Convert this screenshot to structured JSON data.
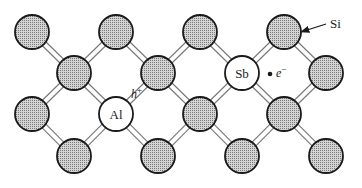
{
  "diagram": {
    "atom_radius": 17,
    "colors": {
      "outline": "#1a1a1a",
      "shaded_fill": "#b8b8b8",
      "impurity_fill": "#ffffff",
      "bond": "#777777"
    },
    "atoms": [
      {
        "id": "a1",
        "x": 32,
        "y": 32,
        "type": "Si",
        "label": ""
      },
      {
        "id": "a2",
        "x": 116,
        "y": 32,
        "type": "Si",
        "label": ""
      },
      {
        "id": "a3",
        "x": 200,
        "y": 32,
        "type": "Si",
        "label": ""
      },
      {
        "id": "a4",
        "x": 284,
        "y": 32,
        "type": "Si",
        "label": ""
      },
      {
        "id": "b1",
        "x": 74,
        "y": 73,
        "type": "Si",
        "label": ""
      },
      {
        "id": "b2",
        "x": 158,
        "y": 73,
        "type": "Si",
        "label": ""
      },
      {
        "id": "b3",
        "x": 242,
        "y": 73,
        "type": "Sb",
        "label": "Sb"
      },
      {
        "id": "b4",
        "x": 326,
        "y": 73,
        "type": "Si",
        "label": ""
      },
      {
        "id": "c1",
        "x": 32,
        "y": 114,
        "type": "Si",
        "label": ""
      },
      {
        "id": "c2",
        "x": 116,
        "y": 114,
        "type": "Al",
        "label": "Al"
      },
      {
        "id": "c3",
        "x": 200,
        "y": 114,
        "type": "Si",
        "label": ""
      },
      {
        "id": "c4",
        "x": 284,
        "y": 114,
        "type": "Si",
        "label": ""
      },
      {
        "id": "d1",
        "x": 74,
        "y": 156,
        "type": "Si",
        "label": ""
      },
      {
        "id": "d2",
        "x": 158,
        "y": 156,
        "type": "Si",
        "label": ""
      },
      {
        "id": "d3",
        "x": 242,
        "y": 156,
        "type": "Si",
        "label": ""
      },
      {
        "id": "d4",
        "x": 326,
        "y": 156,
        "type": "Si",
        "label": ""
      }
    ],
    "bonds": [
      [
        "a1",
        "b1"
      ],
      [
        "a2",
        "b1"
      ],
      [
        "a2",
        "b2"
      ],
      [
        "a3",
        "b2"
      ],
      [
        "a3",
        "b3"
      ],
      [
        "a4",
        "b3"
      ],
      [
        "a4",
        "b4"
      ],
      [
        "b1",
        "c1"
      ],
      [
        "b1",
        "c2"
      ],
      [
        "b2",
        "c2"
      ],
      [
        "b2",
        "c3"
      ],
      [
        "b3",
        "c3"
      ],
      [
        "b3",
        "c4"
      ],
      [
        "b4",
        "c4"
      ],
      [
        "c1",
        "d1"
      ],
      [
        "c2",
        "d1"
      ],
      [
        "c2",
        "d2"
      ],
      [
        "c3",
        "d2"
      ],
      [
        "c3",
        "d3"
      ],
      [
        "c4",
        "d3"
      ],
      [
        "c4",
        "d4"
      ]
    ],
    "annotations": {
      "si_label": {
        "text": "Si",
        "x": 330,
        "y": 28,
        "arrow_from": [
          326,
          24
        ],
        "arrow_to": [
          301,
          32
        ]
      },
      "hole_label": {
        "text": "h",
        "sup": "+",
        "x": 131,
        "y": 98
      },
      "electron_label": {
        "text": "e",
        "sup": "−",
        "x": 276,
        "y": 77,
        "dot_x": 270,
        "dot_y": 74
      }
    }
  }
}
